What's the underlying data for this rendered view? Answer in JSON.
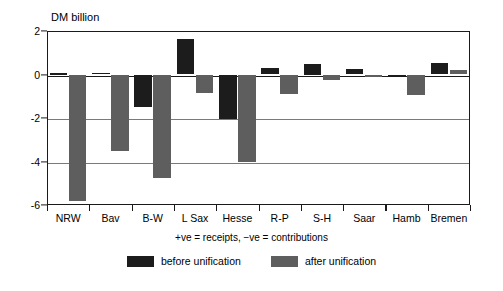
{
  "chart_data": {
    "type": "bar",
    "title": "",
    "subtitle": "",
    "ylabel": "DM billion",
    "xlabel": "",
    "ylim": [
      -6,
      2
    ],
    "yticks": [
      2,
      0,
      -2,
      -4,
      -6
    ],
    "ytick_labels": [
      "2",
      "0",
      "-2",
      "-4",
      "-6"
    ],
    "grid": true,
    "legend_position": "bottom",
    "annotation": "+ve = receipts, −ve = contributions",
    "categories": [
      "NRW",
      "Bav",
      "B-W",
      "L Sax",
      "Hesse",
      "R-P",
      "S-H",
      "Saar",
      "Hamb",
      "Bremen"
    ],
    "series": [
      {
        "name": "before unification",
        "color": "#1c1c1c",
        "values": [
          0.05,
          0.08,
          -1.5,
          1.62,
          -2.05,
          0.28,
          0.5,
          0.27,
          -0.07,
          0.52
        ]
      },
      {
        "name": "after unification",
        "color": "#5e5e5e",
        "values": [
          -5.82,
          -3.52,
          -4.78,
          -0.85,
          -4.0,
          -0.9,
          -0.25,
          -0.1,
          -0.95,
          0.22
        ]
      }
    ]
  },
  "axis": {
    "y_title": "DM billion"
  },
  "footnote": {
    "text": "+ve = receipts, −ve = contributions"
  },
  "legend": {
    "items": [
      {
        "label": "before unification",
        "color": "#1c1c1c"
      },
      {
        "label": "after unification",
        "color": "#5e5e5e"
      }
    ]
  }
}
